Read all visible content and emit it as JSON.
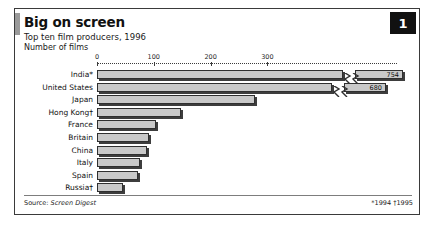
{
  "header": {
    "title": "Big on screen",
    "subtitle": "Top ten film producers, 1996",
    "units": "Number of films",
    "badge": "1"
  },
  "footer": {
    "source_prefix": "Source: ",
    "source_name": "Screen Digest",
    "notes": "*1994  †1995"
  },
  "chart_data": {
    "type": "bar",
    "orientation": "horizontal",
    "title": "Big on screen",
    "subtitle": "Top ten film producers, 1996",
    "xlabel": "Number of films",
    "ylabel": "",
    "xlim": [
      0,
      330
    ],
    "xticks": [
      0,
      100,
      200,
      300
    ],
    "grid": false,
    "legend": null,
    "axis_break": true,
    "categories": [
      "India*",
      "United States",
      "Japan",
      "Hong Kong†",
      "France",
      "Britain",
      "China",
      "Italy",
      "Spain",
      "Russia†"
    ],
    "values": [
      754,
      680,
      278,
      148,
      104,
      92,
      88,
      75,
      72,
      46
    ],
    "value_labels": [
      "754",
      "680",
      "",
      "",
      "",
      "",
      "",
      "",
      "",
      ""
    ],
    "bars": [
      {
        "category": "India*",
        "value": 754,
        "px": 300,
        "broken": true,
        "label": "754"
      },
      {
        "category": "United States",
        "value": 680,
        "px": 290,
        "broken": true,
        "label": "680"
      },
      {
        "category": "Japan",
        "value": 278,
        "px": 158,
        "broken": false,
        "label": ""
      },
      {
        "category": "Hong Kong†",
        "value": 148,
        "px": 84,
        "broken": false,
        "label": ""
      },
      {
        "category": "France",
        "value": 104,
        "px": 59,
        "broken": false,
        "label": ""
      },
      {
        "category": "Britain",
        "value": 92,
        "px": 52,
        "broken": false,
        "label": ""
      },
      {
        "category": "China",
        "value": 88,
        "px": 50,
        "broken": false,
        "label": ""
      },
      {
        "category": "Italy",
        "value": 75,
        "px": 43,
        "broken": false,
        "label": ""
      },
      {
        "category": "Spain",
        "value": 72,
        "px": 41,
        "broken": false,
        "label": ""
      },
      {
        "category": "Russia†",
        "value": 46,
        "px": 26,
        "broken": false,
        "label": ""
      }
    ]
  },
  "colors": {
    "bar_fill": "#c9c9c9",
    "bar_stroke": "#2f2f2f",
    "bar_shadow": "#3d3d3d",
    "badge_bg": "#111111",
    "frame": "#3a3a3a",
    "accent": "#9a9a9a"
  }
}
